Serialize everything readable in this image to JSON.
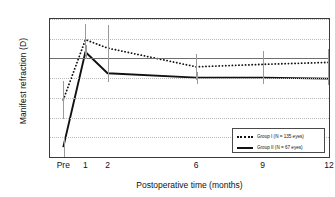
{
  "chart_data": {
    "type": "line",
    "title": "",
    "xlabel": "Postoperative time (months)",
    "ylabel": "Manifest refraction (D)",
    "categories": [
      "Pre",
      "1",
      "2",
      "6",
      "9",
      "12"
    ],
    "x": [
      0,
      1,
      2,
      6,
      9,
      12
    ],
    "xlim": [
      -0.6,
      12
    ],
    "ylim": [
      -10,
      4
    ],
    "yticks": [
      "4",
      "2",
      "0",
      "-2",
      "-4",
      "-6",
      "-8",
      "-10"
    ],
    "ytick_values": [
      4,
      2,
      0,
      -2,
      -4,
      -6,
      -8,
      -10
    ],
    "grid": "horizontal-dotted",
    "zero_line": true,
    "legend_position": "bottom-right",
    "series": [
      {
        "name": "Group I (N = 135 eyes)",
        "style": "dotted",
        "color": "#111111",
        "values": [
          -4.2,
          1.9,
          1.05,
          -0.85,
          -0.6,
          -0.4
        ],
        "errors": [
          1.9,
          1.6,
          2.3,
          1.35,
          1.35,
          1.35
        ]
      },
      {
        "name": "Group II (N = 67 eyes)",
        "style": "solid",
        "color": "#111111",
        "values": [
          -9.0,
          0.65,
          -1.5,
          -1.95,
          -1.95,
          -2.05
        ],
        "errors": [
          1.0,
          0.7,
          0.9,
          0.6,
          0.6,
          0.6
        ]
      }
    ]
  },
  "legend": {
    "entries": [
      {
        "label": "Group I (N = 135 eyes)",
        "marker": "dotted-line-marker"
      },
      {
        "label": "Group II (N = 67 eyes)",
        "marker": "solid-line-marker"
      }
    ]
  }
}
